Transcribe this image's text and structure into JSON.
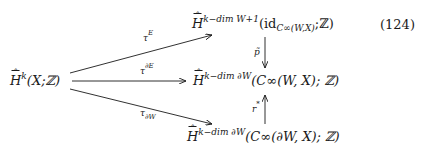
{
  "equation_number": "(124)",
  "nodes": {
    "source": {
      "H": "H",
      "sup": "k",
      "args": "(X;ℤ)"
    },
    "top": {
      "H": "H",
      "sup": "k−dim W+1",
      "args_pre": "(id",
      "sub": "C∞(W,X)",
      "args_post": ";ℤ)"
    },
    "middle": {
      "H": "H",
      "sup": "k−dim ∂W",
      "args": "(C∞(W, X); ℤ)"
    },
    "bottom": {
      "H": "H",
      "sup": "k−dim ∂W",
      "args": "(C∞(∂W, X); ℤ)"
    }
  },
  "arrows": {
    "top": {
      "label": "τ",
      "sup": "E"
    },
    "middle": {
      "label": "τ",
      "sup": "∂E"
    },
    "bottom": {
      "label": "τ",
      "sub": "∂W"
    },
    "down": {
      "label": "p̃"
    },
    "up": {
      "label": "r",
      "sup": "*"
    }
  }
}
